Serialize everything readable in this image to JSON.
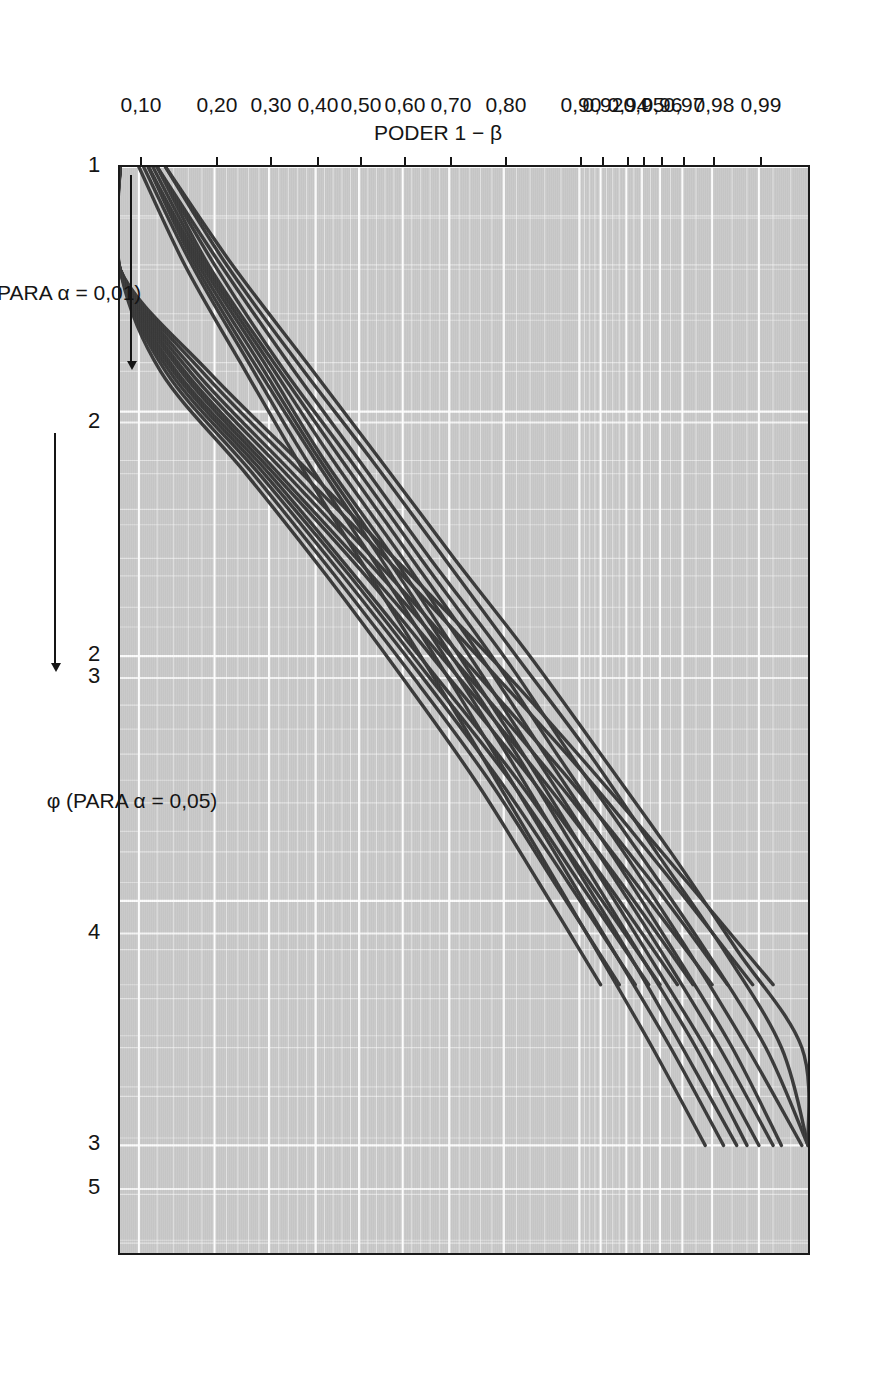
{
  "figure": {
    "kind": "power-curves-chart",
    "caption_language": "pt-BR",
    "y_axis": {
      "title": "PODER 1 − β",
      "ticks": [
        "0,99",
        "0,98",
        "0,97",
        "0,96",
        "0,95",
        "0,94",
        "0,92",
        "0,90",
        "0,80",
        "0,70",
        "0,60",
        "0,50",
        "0,40",
        "0,30",
        "0,20",
        "0,10"
      ]
    },
    "x_axis_primary": {
      "title": "φ (PARA α = 0,01)",
      "arrow": "⟶",
      "ticks": [
        "1",
        "2",
        "3"
      ]
    },
    "x_axis_secondary": {
      "title": "φ (PARA α = 0,05)",
      "arrow": "⟶",
      "ticks": [
        "2",
        "3",
        "4",
        "5"
      ]
    },
    "annotations": {
      "numerator_df": "νₙ = 5",
      "denominator_df": "νᵈ = ∞",
      "alpha_001": "α = 0,01",
      "alpha_005": "α = 0,05"
    },
    "curve_labels_alpha005": [
      "∞",
      "60",
      "30",
      "20",
      "15",
      "12",
      "10",
      "9",
      "8",
      "7",
      "6"
    ],
    "curve_labels_alpha001": [
      "∞",
      "60",
      "30",
      "20",
      "15",
      "12",
      "10",
      "9",
      "8",
      "7",
      "6"
    ],
    "colors": {
      "plot_background": "#c9c9c9",
      "grid": "#ffffff",
      "curve": "#3a3a3a",
      "frame": "#1a1a1a",
      "text": "#151515",
      "page": "#ffffff"
    }
  },
  "chart_data": {
    "type": "line",
    "title": "",
    "subtitle": "",
    "xlabel": "φ (PARA α = 0,01)  /  φ (PARA α = 0,05)",
    "ylabel": "PODER 1 − β",
    "grid": true,
    "legend": "inline curve labels",
    "legend_position": "inline",
    "y_scale": "normal-probability (probit)",
    "ylim": [
      0.1,
      0.995
    ],
    "ytick_values": [
      0.99,
      0.98,
      0.97,
      0.96,
      0.95,
      0.94,
      0.92,
      0.9,
      0.8,
      0.7,
      0.6,
      0.5,
      0.4,
      0.3,
      0.2,
      0.1
    ],
    "ytick_labels": [
      "0,99",
      "0,98",
      "0,97",
      "0,96",
      "0,95",
      "0,94",
      "0,92",
      "0,90",
      "0,80",
      "0,70",
      "0,60",
      "0,50",
      "0,40",
      "0,30",
      "0,20",
      "0,10"
    ],
    "x_axes": [
      {
        "name": "φ (PARA α = 0,05)",
        "xlim": [
          1.0,
          3.2
        ],
        "ticks": [
          1,
          2,
          3
        ],
        "tick_labels": [
          "1",
          "2",
          "3"
        ]
      },
      {
        "name": "φ (PARA α = 0,01)",
        "xlim": [
          1.0,
          5.2
        ],
        "ticks": [
          2,
          3,
          4,
          5
        ],
        "tick_labels": [
          "2",
          "3",
          "4",
          "5"
        ]
      }
    ],
    "series": [
      {
        "name": "α=0,05, νᵈ=∞",
        "alpha": 0.05,
        "nu_d": "inf",
        "x": [
          1.0,
          1.2,
          1.4,
          1.6,
          1.8,
          2.0,
          2.2,
          2.4,
          2.6,
          2.8,
          3.0
        ],
        "values": [
          0.13,
          0.23,
          0.38,
          0.55,
          0.71,
          0.84,
          0.92,
          0.965,
          0.986,
          0.995,
          0.998
        ]
      },
      {
        "name": "α=0,05, νᵈ=60",
        "alpha": 0.05,
        "nu_d": 60,
        "x": [
          1.0,
          1.2,
          1.4,
          1.6,
          1.8,
          2.0,
          2.2,
          2.4,
          2.6,
          2.8,
          3.0
        ],
        "values": [
          0.13,
          0.22,
          0.36,
          0.53,
          0.69,
          0.82,
          0.91,
          0.958,
          0.983,
          0.993,
          0.997
        ]
      },
      {
        "name": "α=0,05, νᵈ=30",
        "alpha": 0.05,
        "nu_d": 30,
        "x": [
          1.0,
          1.2,
          1.4,
          1.6,
          1.8,
          2.0,
          2.2,
          2.4,
          2.6,
          2.8,
          3.0
        ],
        "values": [
          0.12,
          0.21,
          0.34,
          0.5,
          0.66,
          0.8,
          0.89,
          0.948,
          0.978,
          0.991,
          0.996
        ]
      },
      {
        "name": "α=0,05, νᵈ=20",
        "alpha": 0.05,
        "nu_d": 20,
        "x": [
          1.0,
          1.2,
          1.4,
          1.6,
          1.8,
          2.0,
          2.2,
          2.4,
          2.6,
          2.8,
          3.0
        ],
        "values": [
          0.12,
          0.2,
          0.32,
          0.48,
          0.64,
          0.78,
          0.875,
          0.938,
          0.972,
          0.988,
          0.995
        ]
      },
      {
        "name": "α=0,05, νᵈ=15",
        "alpha": 0.05,
        "nu_d": 15,
        "x": [
          1.0,
          1.2,
          1.4,
          1.6,
          1.8,
          2.0,
          2.2,
          2.4,
          2.6,
          2.8,
          3.0
        ],
        "values": [
          0.12,
          0.19,
          0.31,
          0.46,
          0.62,
          0.76,
          0.86,
          0.928,
          0.966,
          0.985,
          0.993
        ]
      },
      {
        "name": "α=0,05, νᵈ=12",
        "alpha": 0.05,
        "nu_d": 12,
        "x": [
          1.0,
          1.2,
          1.4,
          1.6,
          1.8,
          2.0,
          2.2,
          2.4,
          2.6,
          2.8,
          3.0
        ],
        "values": [
          0.115,
          0.185,
          0.3,
          0.44,
          0.6,
          0.74,
          0.845,
          0.917,
          0.96,
          0.982,
          0.992
        ]
      },
      {
        "name": "α=0,05, νᵈ=10",
        "alpha": 0.05,
        "nu_d": 10,
        "x": [
          1.0,
          1.2,
          1.4,
          1.6,
          1.8,
          2.0,
          2.2,
          2.4,
          2.6,
          2.8,
          3.0
        ],
        "values": [
          0.11,
          0.18,
          0.29,
          0.42,
          0.58,
          0.72,
          0.83,
          0.905,
          0.952,
          0.978,
          0.99
        ]
      },
      {
        "name": "α=0,05, νᵈ=9",
        "alpha": 0.05,
        "nu_d": 9,
        "x": [
          1.0,
          1.2,
          1.4,
          1.6,
          1.8,
          2.0,
          2.2,
          2.4,
          2.6,
          2.8,
          3.0
        ],
        "values": [
          0.11,
          0.175,
          0.28,
          0.41,
          0.565,
          0.705,
          0.82,
          0.897,
          0.947,
          0.975,
          0.988
        ]
      },
      {
        "name": "α=0,05, νᵈ=8",
        "alpha": 0.05,
        "nu_d": 8,
        "x": [
          1.0,
          1.2,
          1.4,
          1.6,
          1.8,
          2.0,
          2.2,
          2.4,
          2.6,
          2.8,
          3.0
        ],
        "values": [
          0.11,
          0.17,
          0.27,
          0.4,
          0.55,
          0.69,
          0.805,
          0.886,
          0.94,
          0.97,
          0.986
        ]
      },
      {
        "name": "α=0,05, νᵈ=7",
        "alpha": 0.05,
        "nu_d": 7,
        "x": [
          1.0,
          1.2,
          1.4,
          1.6,
          1.8,
          2.0,
          2.2,
          2.4,
          2.6,
          2.8,
          3.0
        ],
        "values": [
          0.105,
          0.165,
          0.26,
          0.38,
          0.53,
          0.67,
          0.785,
          0.872,
          0.93,
          0.965,
          0.983
        ]
      },
      {
        "name": "α=0,05, νᵈ=6",
        "alpha": 0.05,
        "nu_d": 6,
        "x": [
          1.0,
          1.2,
          1.4,
          1.6,
          1.8,
          2.0,
          2.2,
          2.4,
          2.6,
          2.8,
          3.0
        ],
        "values": [
          0.1,
          0.155,
          0.245,
          0.36,
          0.5,
          0.64,
          0.76,
          0.852,
          0.916,
          0.956,
          0.978
        ]
      },
      {
        "name": "α=0,01, νᵈ=∞",
        "alpha": 0.01,
        "nu_d": "inf",
        "x": [
          1.0,
          1.4,
          1.8,
          2.2,
          2.6,
          3.0,
          3.4,
          3.8,
          4.2
        ],
        "values": [
          0.02,
          0.07,
          0.19,
          0.39,
          0.62,
          0.81,
          0.92,
          0.972,
          0.992
        ]
      },
      {
        "name": "α=0,01, νᵈ=60",
        "alpha": 0.01,
        "nu_d": 60,
        "x": [
          1.0,
          1.4,
          1.8,
          2.2,
          2.6,
          3.0,
          3.4,
          3.8,
          4.2
        ],
        "values": [
          0.02,
          0.066,
          0.18,
          0.37,
          0.6,
          0.79,
          0.91,
          0.966,
          0.989
        ]
      },
      {
        "name": "α=0,01, νᵈ=30",
        "alpha": 0.01,
        "nu_d": 30,
        "x": [
          1.0,
          1.4,
          1.8,
          2.2,
          2.6,
          3.0,
          3.4,
          3.8,
          4.2
        ],
        "values": [
          0.02,
          0.062,
          0.17,
          0.35,
          0.57,
          0.76,
          0.89,
          0.956,
          0.984
        ]
      },
      {
        "name": "α=0,01, νᵈ=20",
        "alpha": 0.01,
        "nu_d": 20,
        "x": [
          1.0,
          1.4,
          1.8,
          2.2,
          2.6,
          3.0,
          3.4,
          3.8,
          4.2
        ],
        "values": [
          0.02,
          0.06,
          0.162,
          0.335,
          0.55,
          0.74,
          0.874,
          0.946,
          0.98
        ]
      },
      {
        "name": "α=0,01, νᵈ=15",
        "alpha": 0.01,
        "nu_d": 15,
        "x": [
          1.0,
          1.4,
          1.8,
          2.2,
          2.6,
          3.0,
          3.4,
          3.8,
          4.2
        ],
        "values": [
          0.019,
          0.058,
          0.155,
          0.32,
          0.53,
          0.72,
          0.858,
          0.936,
          0.974
        ]
      },
      {
        "name": "α=0,01, νᵈ=12",
        "alpha": 0.01,
        "nu_d": 12,
        "x": [
          1.0,
          1.4,
          1.8,
          2.2,
          2.6,
          3.0,
          3.4,
          3.8,
          4.2
        ],
        "values": [
          0.019,
          0.056,
          0.15,
          0.31,
          0.515,
          0.7,
          0.843,
          0.925,
          0.968
        ]
      },
      {
        "name": "α=0,01, νᵈ=10",
        "alpha": 0.01,
        "nu_d": 10,
        "x": [
          1.0,
          1.4,
          1.8,
          2.2,
          2.6,
          3.0,
          3.4,
          3.8,
          4.2
        ],
        "values": [
          0.018,
          0.054,
          0.144,
          0.3,
          0.49,
          0.675,
          0.822,
          0.91,
          0.96
        ]
      },
      {
        "name": "α=0,01, νᵈ=9",
        "alpha": 0.01,
        "nu_d": 9,
        "x": [
          1.0,
          1.4,
          1.8,
          2.2,
          2.6,
          3.0,
          3.4,
          3.8,
          4.2
        ],
        "values": [
          0.018,
          0.053,
          0.14,
          0.29,
          0.478,
          0.66,
          0.81,
          0.9,
          0.954
        ]
      },
      {
        "name": "α=0,01, νᵈ=8",
        "alpha": 0.01,
        "nu_d": 8,
        "x": [
          1.0,
          1.4,
          1.8,
          2.2,
          2.6,
          3.0,
          3.4,
          3.8,
          4.2
        ],
        "values": [
          0.017,
          0.051,
          0.135,
          0.28,
          0.462,
          0.645,
          0.793,
          0.888,
          0.946
        ]
      },
      {
        "name": "α=0,01, νᵈ=7",
        "alpha": 0.01,
        "nu_d": 7,
        "x": [
          1.0,
          1.4,
          1.8,
          2.2,
          2.6,
          3.0,
          3.4,
          3.8,
          4.2
        ],
        "values": [
          0.017,
          0.049,
          0.13,
          0.268,
          0.444,
          0.625,
          0.775,
          0.872,
          0.935
        ]
      },
      {
        "name": "α=0,01, νᵈ=6",
        "alpha": 0.01,
        "nu_d": 6,
        "x": [
          1.0,
          1.4,
          1.8,
          2.2,
          2.6,
          3.0,
          3.4,
          3.8,
          4.2
        ],
        "values": [
          0.016,
          0.047,
          0.124,
          0.255,
          0.425,
          0.6,
          0.75,
          0.852,
          0.92
        ]
      }
    ]
  }
}
